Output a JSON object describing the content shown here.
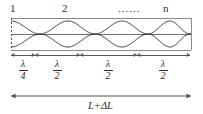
{
  "figure": {
    "mode_labels": [
      {
        "text": "1",
        "x": 10,
        "y": 3
      },
      {
        "text": "2",
        "x": 62,
        "y": 3
      },
      {
        "text": "n",
        "x": 163,
        "y": 3
      }
    ],
    "ellipsis": {
      "text": "......",
      "x": 118,
      "y": 3
    },
    "cavity": {
      "left": 11,
      "right": 191,
      "top": 18,
      "bottom": 50,
      "axis_y": 34,
      "amplitude": 13,
      "left_edge_style": "dashed",
      "border_color": "#8a8a8a",
      "wave_color": "#333333",
      "nodes": [
        40,
        95,
        148,
        190
      ],
      "antinodes": [
        11,
        68,
        122,
        170
      ]
    },
    "dimension_row": {
      "y": 55,
      "ticks": [
        11,
        35,
        80,
        137,
        190
      ],
      "segments": [
        {
          "numerator": "λ",
          "denominator": "4",
          "center": 23
        },
        {
          "numerator": "λ",
          "denominator": "2",
          "center": 57
        },
        {
          "numerator": "λ",
          "denominator": "2",
          "center": 108
        },
        {
          "numerator": "λ",
          "denominator": "2",
          "center": 163
        }
      ]
    },
    "total_dimension": {
      "label": "L+ΔL",
      "y": 96,
      "left": 11,
      "right": 191,
      "label_x": 88,
      "label_y": 100
    },
    "colors": {
      "ink": "#2b2b2b",
      "wave": "#333333",
      "box": "#8a8a8a",
      "rule": "#555555",
      "background": "#ffffff"
    }
  }
}
